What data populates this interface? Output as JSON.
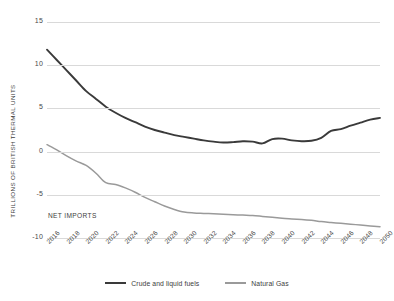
{
  "chart_data": {
    "type": "line",
    "title": "",
    "subtitle": "",
    "xlabel": "",
    "ylabel": "TRILLIONS OF  BRITISH THERMAL UNITS",
    "ylim": [
      -10,
      15
    ],
    "xlim": [
      2016,
      2050
    ],
    "grid": true,
    "legend_position": "bottom-center",
    "y_ticks": [
      "15",
      "10",
      "5",
      "0",
      "-5",
      "-10"
    ],
    "y_tick_values": [
      15,
      10,
      5,
      0,
      -5,
      -10
    ],
    "x": [
      2016,
      2017,
      2018,
      2019,
      2020,
      2021,
      2022,
      2023,
      2024,
      2025,
      2026,
      2027,
      2028,
      2029,
      2030,
      2031,
      2032,
      2033,
      2034,
      2035,
      2036,
      2037,
      2038,
      2039,
      2040,
      2041,
      2042,
      2043,
      2044,
      2045,
      2046,
      2047,
      2048,
      2049,
      2050
    ],
    "x_tick_labels": [
      "2016",
      "2018",
      "2020",
      "2022",
      "2024",
      "2026",
      "2028",
      "2030",
      "2032",
      "2034",
      "2036",
      "2038",
      "2040",
      "2042",
      "2044",
      "2046",
      "2048",
      "2050"
    ],
    "annotations": [
      {
        "text": "NET IMPORTS",
        "x": 2016,
        "y": -9.0
      }
    ],
    "series": [
      {
        "name": "Crude and liquid fuels",
        "color": "#3a3a3a",
        "values": [
          11.8,
          10.6,
          9.4,
          8.2,
          7.0,
          6.1,
          5.2,
          4.5,
          3.9,
          3.4,
          2.9,
          2.5,
          2.2,
          1.9,
          1.7,
          1.5,
          1.3,
          1.15,
          1.05,
          1.1,
          1.2,
          1.15,
          0.95,
          1.45,
          1.5,
          1.3,
          1.2,
          1.25,
          1.6,
          2.4,
          2.6,
          3.0,
          3.35,
          3.7,
          3.9
        ]
      },
      {
        "name": "Natural Gas",
        "color": "#9a9a9a",
        "values": [
          0.8,
          0.2,
          -0.5,
          -1.1,
          -1.6,
          -2.5,
          -3.6,
          -3.8,
          -4.2,
          -4.7,
          -5.3,
          -5.8,
          -6.3,
          -6.7,
          -7.0,
          -7.1,
          -7.15,
          -7.2,
          -7.25,
          -7.3,
          -7.35,
          -7.4,
          -7.5,
          -7.6,
          -7.7,
          -7.8,
          -7.85,
          -7.95,
          -8.1,
          -8.2,
          -8.3,
          -8.4,
          -8.5,
          -8.6,
          -8.7
        ]
      }
    ]
  },
  "legend": {
    "items": [
      {
        "label": "Crude and liquid fuels",
        "color": "#3a3a3a"
      },
      {
        "label": "Natural Gas",
        "color": "#9a9a9a"
      }
    ]
  }
}
